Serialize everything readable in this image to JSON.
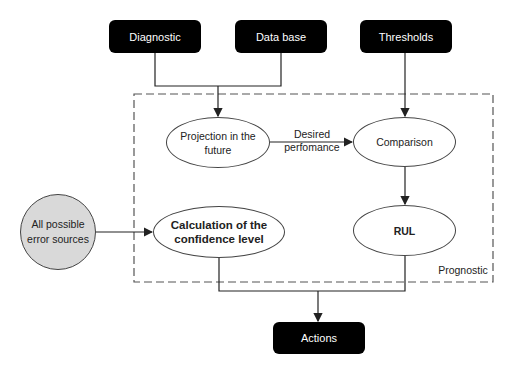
{
  "inputs": {
    "diagnostic": "Diagnostic",
    "database": "Data base",
    "thresholds": "Thresholds"
  },
  "prognostic": {
    "group_label": "Prognostic",
    "projection": "Projection in the future",
    "desired_performance": "Desired perfomance",
    "comparison": "Comparison",
    "calculation": "Calculation of the confidence level",
    "rul": "RUL"
  },
  "error_sources": "All possible error sources",
  "output": {
    "actions": "Actions"
  },
  "colors": {
    "box_fill": "#000000",
    "box_text": "#ffffff",
    "circle_fill": "#d9d9d9",
    "line": "#222222"
  }
}
